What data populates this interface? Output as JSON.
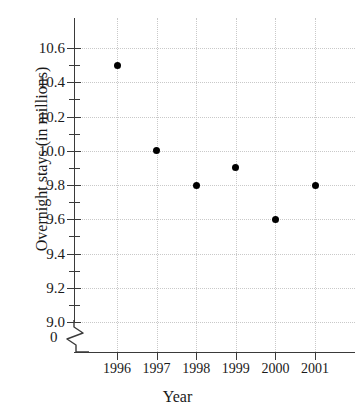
{
  "chart_data": {
    "type": "scatter",
    "title": "",
    "xlabel": "Year",
    "ylabel": "Overnight stays (in millions)",
    "categories": [
      "1996",
      "1997",
      "1998",
      "1999",
      "2000",
      "2001"
    ],
    "x": [
      1996,
      1997,
      1998,
      1999,
      2000,
      2001
    ],
    "values": [
      10.5,
      10.0,
      9.8,
      9.9,
      9.6,
      9.8
    ],
    "series": [
      {
        "name": "Overnight stays",
        "values": [
          10.5,
          10.0,
          9.8,
          9.9,
          9.6,
          9.8
        ]
      }
    ],
    "points": [
      {
        "x": "1996",
        "y": 10.5
      },
      {
        "x": "1997",
        "y": 10.0
      },
      {
        "x": "1998",
        "y": 9.8
      },
      {
        "x": "1999",
        "y": 9.9
      },
      {
        "x": "2000",
        "y": 9.6
      },
      {
        "x": "2001",
        "y": 9.8
      }
    ],
    "ylim": [
      9.0,
      10.7
    ],
    "xlim": [
      1995.5,
      2001.8
    ],
    "y_major_ticks": [
      9.0,
      9.2,
      9.4,
      9.6,
      9.8,
      10.0,
      10.2,
      10.4,
      10.6
    ],
    "y_minor_ticks": [
      9.1,
      9.3,
      9.5,
      9.7,
      9.9,
      10.1,
      10.3,
      10.5
    ],
    "y_tick_labels": [
      "9.0",
      "9.2",
      "9.4",
      "9.6",
      "9.8",
      "10.0",
      "10.2",
      "10.4",
      "10.6"
    ],
    "origin_label": "0",
    "axis_break": true,
    "grid": true,
    "legend": "none",
    "marker": "filled-circle",
    "marker_color": "#000000",
    "grid_color": "#c9c9c9",
    "axis_color": "#3a3a3a"
  }
}
